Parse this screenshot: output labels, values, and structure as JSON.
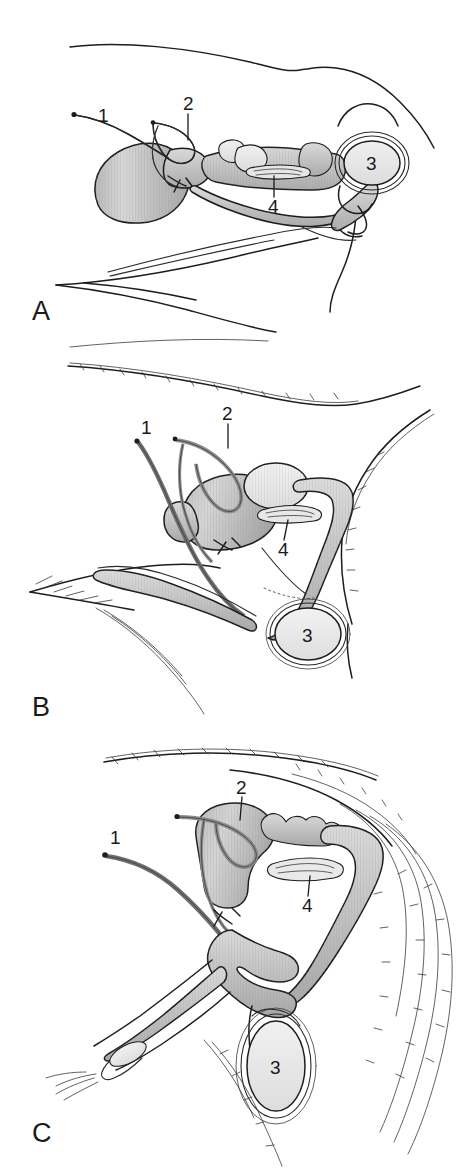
{
  "figure": {
    "background_color": "#ffffff",
    "ink_color": "#1d1d1d",
    "width": 471,
    "height": 1171
  },
  "legend_keys": [
    {
      "number": "1",
      "name": "ductus-deferens"
    },
    {
      "number": "2",
      "name": "ureter"
    },
    {
      "number": "3",
      "name": "testis"
    },
    {
      "number": "4",
      "name": "prostate-gland"
    }
  ],
  "panels": [
    {
      "id": "A",
      "letter": "A",
      "name": "panel-a-boar",
      "labels": [
        {
          "number": "1",
          "target": "ductus-deferens"
        },
        {
          "number": "2",
          "target": "ureter"
        },
        {
          "number": "3",
          "target": "testis"
        },
        {
          "number": "4",
          "target": "prostate-gland"
        }
      ]
    },
    {
      "id": "B",
      "letter": "B",
      "name": "panel-b-bull",
      "labels": [
        {
          "number": "1",
          "target": "ductus-deferens"
        },
        {
          "number": "2",
          "target": "ureter"
        },
        {
          "number": "3",
          "target": "testis"
        },
        {
          "number": "4",
          "target": "prostate-gland"
        }
      ]
    },
    {
      "id": "C",
      "letter": "C",
      "name": "panel-c-stallion",
      "labels": [
        {
          "number": "1",
          "target": "ductus-deferens"
        },
        {
          "number": "2",
          "target": "ureter"
        },
        {
          "number": "3",
          "target": "testis"
        },
        {
          "number": "4",
          "target": "prostate-gland"
        }
      ]
    }
  ]
}
